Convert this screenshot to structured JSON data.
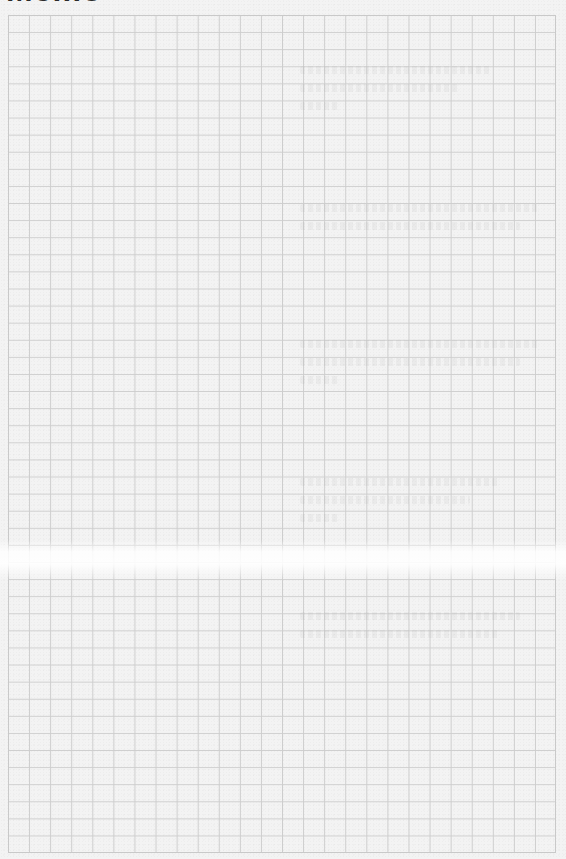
{
  "memo": {
    "title": "Memo",
    "grid": {
      "columns": 26,
      "rows": 49,
      "line_color": "#cdcdcd",
      "paper_color": "#f3f3f3"
    }
  }
}
